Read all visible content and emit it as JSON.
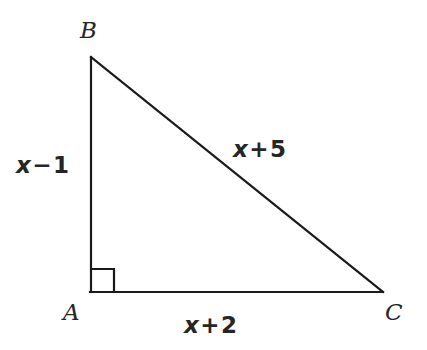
{
  "figure": {
    "kind": "right-triangle-geometry-diagram",
    "background_color": "#ffffff",
    "stroke_color": "#1a1a1a",
    "text_color": "#262626",
    "stroke_width": 2
  },
  "vertices": {
    "B": {
      "label": "B",
      "x": 91,
      "y": 57
    },
    "A": {
      "label": "A",
      "x": 91,
      "y": 292
    },
    "C": {
      "label": "C",
      "x": 382,
      "y": 292
    }
  },
  "right_angle": {
    "at_vertex": "A",
    "marker": "square",
    "size": 22
  },
  "sides": {
    "AB": {
      "expression": "x − 1",
      "variable": "x",
      "operator": "−",
      "constant": "1",
      "position": "left"
    },
    "BC": {
      "expression": "x + 5",
      "variable": "x",
      "operator": "+",
      "constant": "5",
      "position": "hypotenuse"
    },
    "AC": {
      "expression": "x + 2",
      "variable": "x",
      "operator": "+",
      "constant": "2",
      "position": "bottom"
    }
  }
}
